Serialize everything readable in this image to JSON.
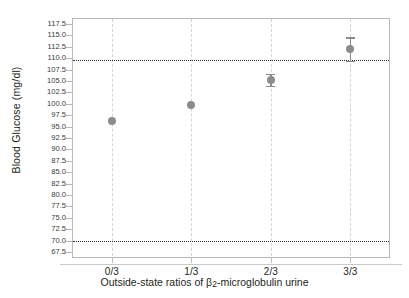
{
  "chart_data": {
    "type": "scatter",
    "title": "",
    "xlabel": "Outside-state ratios of β2-microglobulin urine",
    "xlabel_parts": {
      "pre": "Outside-state ratios of β",
      "sub": "2",
      "post": "-microglobulin urine"
    },
    "ylabel": "Blood Glucose (mg/dl)",
    "categories": [
      "0/3",
      "1/3",
      "2/3",
      "3/3"
    ],
    "values": [
      96.3,
      99.8,
      105.2,
      112.0
    ],
    "err_low": [
      0.0,
      0.0,
      1.3,
      2.6
    ],
    "err_high": [
      0.0,
      0.0,
      1.3,
      2.6
    ],
    "ylim": [
      66.2,
      118.8
    ],
    "yticks": [
      117.5,
      115.0,
      112.5,
      110.0,
      107.5,
      105.0,
      102.5,
      100.0,
      97.5,
      95.0,
      92.5,
      90.0,
      87.5,
      85.0,
      82.5,
      80.0,
      77.5,
      75.0,
      72.5,
      70.0,
      67.5
    ],
    "ytick_labels": [
      "117.5",
      "115.0",
      "112.5",
      "110.0",
      "107.5",
      "105.0",
      "102.5",
      "100.0",
      "97.5",
      "95.0",
      "92.5",
      "90.0",
      "87.5",
      "85.0",
      "82.5",
      "80.0",
      "77.5",
      "75.0",
      "72.5",
      "70.0",
      "67.5"
    ],
    "reference_lines": [
      {
        "name": "upper-reference-line",
        "value": 109.5,
        "style": "dotted"
      },
      {
        "name": "lower-reference-line",
        "value": 70.0,
        "style": "dotted"
      }
    ],
    "grid": {
      "vertical": true,
      "vertical_style": "dashed",
      "horizontal": false
    },
    "legend": {
      "visible": false
    },
    "colors": {
      "marker": "#8c8c8c",
      "error_bar": "#8a8a8a",
      "reference_line": "#2a2a2a",
      "grid": "#d4d4d4",
      "axis": "#b9b9b9",
      "text": "#231f20"
    }
  }
}
